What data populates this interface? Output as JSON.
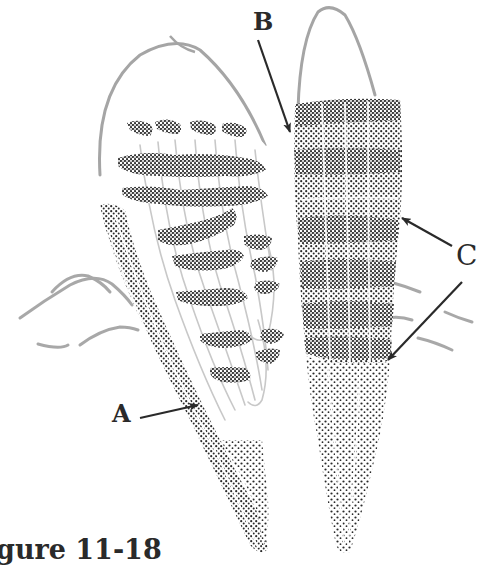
{
  "figure": {
    "caption": "gure 11-18",
    "labels": {
      "a": "A",
      "b": "B",
      "c": "C"
    },
    "colors": {
      "ink": "#2a2a2a",
      "light_ink": "#9a9a9a",
      "background": "#ffffff"
    }
  }
}
